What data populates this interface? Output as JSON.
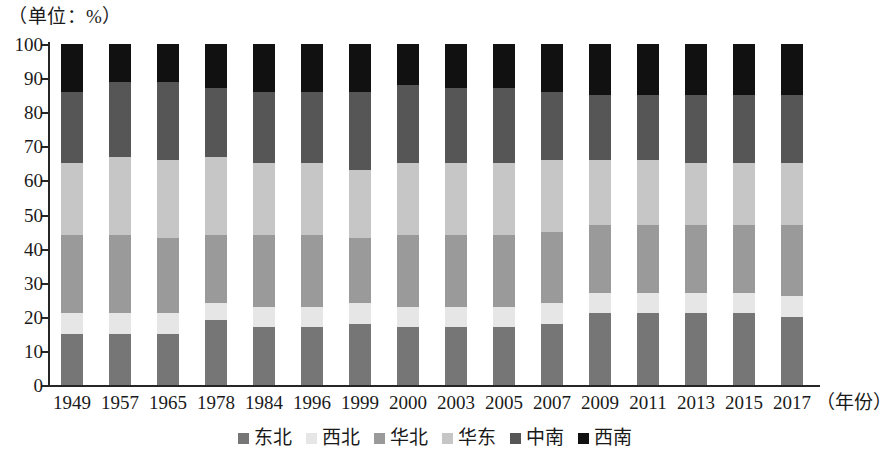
{
  "unit_caption": "（单位：%）",
  "xaxis_title": "（年份）",
  "legend": [
    {
      "label": "东北",
      "color": "#767676"
    },
    {
      "label": "西北",
      "color": "#e6e6e6"
    },
    {
      "label": "华北",
      "color": "#9a9a9a"
    },
    {
      "label": "华东",
      "color": "#c6c6c6"
    },
    {
      "label": "中南",
      "color": "#565656"
    },
    {
      "label": "西南",
      "color": "#111111"
    }
  ],
  "yticks": [
    0,
    10,
    20,
    30,
    40,
    50,
    60,
    70,
    80,
    90,
    100
  ],
  "chart_data": {
    "type": "bar",
    "stacked": true,
    "title": "",
    "subtitle": "（单位：%）",
    "xlabel": "（年份）",
    "ylabel": "（单位：%）",
    "ylim": [
      0,
      100
    ],
    "ytick_step": 10,
    "grid": false,
    "legend_position": "bottom",
    "categories": [
      "1949",
      "1957",
      "1965",
      "1978",
      "1984",
      "1996",
      "1999",
      "2000",
      "2003",
      "2005",
      "2007",
      "2009",
      "2011",
      "2013",
      "2015",
      "2017"
    ],
    "series": [
      {
        "name": "东北",
        "color": "#767676",
        "values": [
          15,
          15,
          15,
          19,
          17,
          17,
          18,
          17,
          17,
          17,
          18,
          21,
          21,
          21,
          21,
          20
        ]
      },
      {
        "name": "西北",
        "color": "#e6e6e6",
        "values": [
          6,
          6,
          6,
          5,
          6,
          6,
          6,
          6,
          6,
          6,
          6,
          6,
          6,
          6,
          6,
          6
        ]
      },
      {
        "name": "华北",
        "color": "#9a9a9a",
        "values": [
          23,
          23,
          22,
          20,
          21,
          21,
          19,
          21,
          21,
          21,
          21,
          20,
          20,
          20,
          20,
          21
        ]
      },
      {
        "name": "华东",
        "color": "#c6c6c6",
        "values": [
          21,
          23,
          23,
          23,
          21,
          21,
          20,
          21,
          21,
          21,
          21,
          19,
          19,
          18,
          18,
          18
        ]
      },
      {
        "name": "中南",
        "color": "#565656",
        "values": [
          21,
          22,
          23,
          20,
          21,
          21,
          23,
          23,
          22,
          22,
          20,
          19,
          19,
          20,
          20,
          20
        ]
      },
      {
        "name": "西南",
        "color": "#111111",
        "values": [
          14,
          11,
          11,
          13,
          14,
          14,
          14,
          12,
          13,
          13,
          14,
          15,
          15,
          15,
          15,
          15
        ]
      }
    ]
  }
}
